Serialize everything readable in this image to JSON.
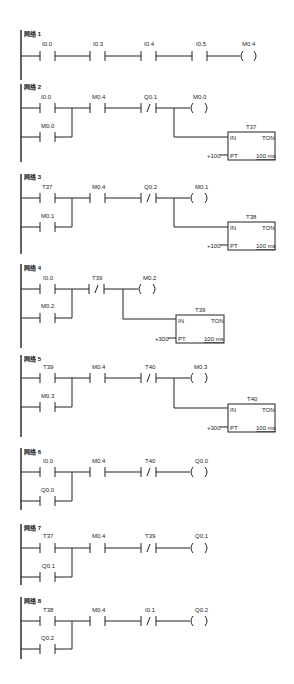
{
  "diagram": {
    "type": "ladder-logic",
    "networks": [
      {
        "title": "网络 1",
        "contacts": [
          {
            "addr": "I0.0",
            "nc": false
          },
          {
            "addr": "I0.3",
            "nc": false
          },
          {
            "addr": "I0.4",
            "nc": false
          },
          {
            "addr": "I0.5",
            "nc": false
          }
        ],
        "coil": "M0.4"
      },
      {
        "title": "网络 2",
        "branch": {
          "main": "I0.0",
          "hold": "M0.0"
        },
        "series": [
          {
            "addr": "M0.4",
            "nc": false
          },
          {
            "addr": "Q0.1",
            "nc": true
          }
        ],
        "coil": "M0.0",
        "timer": {
          "name": "T37",
          "type": "TON",
          "in": "IN",
          "pt_label": "PT",
          "pt": "+100",
          "base": "100 ms"
        }
      },
      {
        "title": "网络 3",
        "branch": {
          "main": "T37",
          "hold": "M0.1"
        },
        "series": [
          {
            "addr": "M0.4",
            "nc": false
          },
          {
            "addr": "Q0.2",
            "nc": true
          }
        ],
        "coil": "M0.1",
        "timer": {
          "name": "T38",
          "type": "TON",
          "in": "IN",
          "pt_label": "PT",
          "pt": "+100",
          "base": "100 ms"
        }
      },
      {
        "title": "网络 4",
        "branch": {
          "main": "I0.0",
          "hold": "M0.2"
        },
        "series": [
          {
            "addr": "T39",
            "nc": true
          }
        ],
        "coil": "M0.2",
        "timer": {
          "name": "T39",
          "type": "TON",
          "in": "IN",
          "pt_label": "PT",
          "pt": "+300",
          "base": "100 ms"
        }
      },
      {
        "title": "网络 5",
        "branch": {
          "main": "T39",
          "hold": "M0.3"
        },
        "series": [
          {
            "addr": "M0.4",
            "nc": false
          },
          {
            "addr": "T40",
            "nc": true
          }
        ],
        "coil": "M0.3",
        "timer": {
          "name": "T40",
          "type": "TON",
          "in": "IN",
          "pt_label": "PT",
          "pt": "+300",
          "base": "100 ms"
        }
      },
      {
        "title": "网络 6",
        "branch": {
          "main": "I0.0",
          "hold": "Q0.0"
        },
        "series": [
          {
            "addr": "M0.4",
            "nc": false
          },
          {
            "addr": "T40",
            "nc": true
          }
        ],
        "coil": "Q0.0"
      },
      {
        "title": "网络 7",
        "branch": {
          "main": "T37",
          "hold": "Q0.1"
        },
        "series": [
          {
            "addr": "M0.4",
            "nc": false
          },
          {
            "addr": "T39",
            "nc": true
          }
        ],
        "coil": "Q0.1"
      },
      {
        "title": "网络 8",
        "branch": {
          "main": "T38",
          "hold": "Q0.2"
        },
        "series": [
          {
            "addr": "M0.4",
            "nc": false
          },
          {
            "addr": "I0.1",
            "nc": true
          }
        ],
        "coil": "Q0.2"
      }
    ]
  },
  "n1": {
    "title": "网络 1",
    "c1": "I0.0",
    "c2": "I0.3",
    "c3": "I0.4",
    "c4": "I0.5",
    "coil": "M0.4"
  },
  "n2": {
    "title": "网络 2",
    "c1": "I0.0",
    "hold": "M0.0",
    "c2": "M0.4",
    "c3": "Q0.1",
    "coil": "M0.0",
    "t_name": "T37",
    "t_in": "IN",
    "t_type": "TON",
    "t_pt": "PT",
    "t_val": "+100",
    "t_base": "100 ms"
  },
  "n3": {
    "title": "网络 3",
    "c1": "T37",
    "hold": "M0.1",
    "c2": "M0.4",
    "c3": "Q0.2",
    "coil": "M0.1",
    "t_name": "T38",
    "t_in": "IN",
    "t_type": "TON",
    "t_pt": "PT",
    "t_val": "+100",
    "t_base": "100 ms"
  },
  "n4": {
    "title": "网络 4",
    "c1": "I0.0",
    "hold": "M0.2",
    "c2": "T39",
    "coil": "M0.2",
    "t_name": "T39",
    "t_in": "IN",
    "t_type": "TON",
    "t_pt": "PT",
    "t_val": "+300",
    "t_base": "100 ms"
  },
  "n5": {
    "title": "网络 5",
    "c1": "T39",
    "hold": "M0.3",
    "c2": "M0.4",
    "c3": "T40",
    "coil": "M0.3",
    "t_name": "T40",
    "t_in": "IN",
    "t_type": "TON",
    "t_pt": "PT",
    "t_val": "+300",
    "t_base": "100 ms"
  },
  "n6": {
    "title": "网络 6",
    "c1": "I0.0",
    "hold": "Q0.0",
    "c2": "M0.4",
    "c3": "T40",
    "coil": "Q0.0"
  },
  "n7": {
    "title": "网络 7",
    "c1": "T37",
    "hold": "Q0.1",
    "c2": "M0.4",
    "c3": "T39",
    "coil": "Q0.1"
  },
  "n8": {
    "title": "网络 8",
    "c1": "T38",
    "hold": "Q0.2",
    "c2": "M0.4",
    "c3": "I0.1",
    "coil": "Q0.2"
  },
  "nc_mark": "/"
}
